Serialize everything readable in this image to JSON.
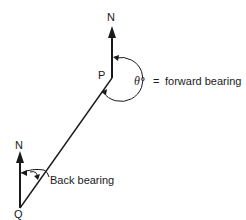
{
  "diagram": {
    "type": "bearing-diagram",
    "points": {
      "P": {
        "label": "P"
      },
      "Q": {
        "label": "Q"
      }
    },
    "north_labels": {
      "at_P": "N",
      "at_Q": "N"
    },
    "annotations": {
      "forward_symbol": "θ°",
      "forward_equals": "=",
      "forward_text": "forward bearing",
      "back_text": "Back bearing"
    },
    "colors": {
      "line": "#1a1a1a",
      "background": "#ffffff"
    }
  }
}
